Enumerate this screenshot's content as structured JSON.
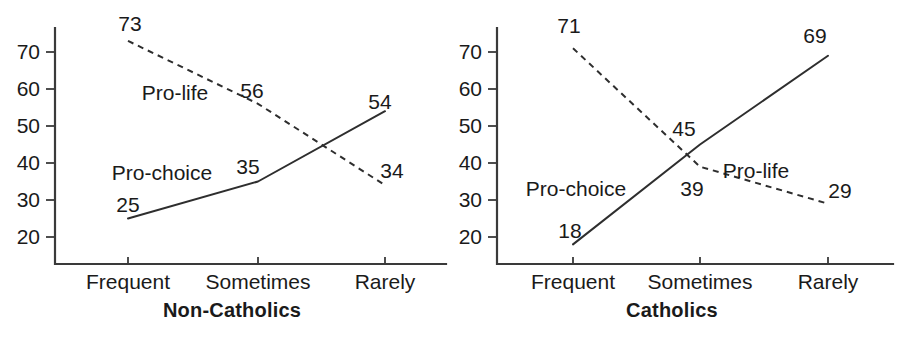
{
  "figure": {
    "background": "#ffffff",
    "ink_color": "#2e2e2e",
    "panel_count": 2
  },
  "chart_data": [
    {
      "type": "line",
      "title": "Non-Catholics",
      "xlabel": "",
      "ylabel": "",
      "categories": [
        "Frequent",
        "Sometimes",
        "Rarely"
      ],
      "yticks": [
        20,
        30,
        40,
        50,
        60,
        70
      ],
      "ylim": [
        15,
        77
      ],
      "grid": false,
      "legend_position": "inline-annotation",
      "series": [
        {
          "name": "Pro-life",
          "style": "dashed",
          "values": [
            73,
            56,
            34
          ],
          "point_labels": [
            "73",
            "56",
            "34"
          ],
          "label_text": "Pro-life"
        },
        {
          "name": "Pro-choice",
          "style": "solid",
          "values": [
            25,
            35,
            54
          ],
          "point_labels": [
            "25",
            "35",
            "54"
          ],
          "label_text": "Pro-choice"
        }
      ]
    },
    {
      "type": "line",
      "title": "Catholics",
      "xlabel": "",
      "ylabel": "",
      "categories": [
        "Frequent",
        "Sometimes",
        "Rarely"
      ],
      "yticks": [
        20,
        30,
        40,
        50,
        60,
        70
      ],
      "ylim": [
        15,
        77
      ],
      "grid": false,
      "legend_position": "inline-annotation",
      "series": [
        {
          "name": "Pro-life",
          "style": "dashed",
          "values": [
            71,
            39,
            29
          ],
          "point_labels": [
            "71",
            "39",
            "29"
          ],
          "label_text": "Pro-life"
        },
        {
          "name": "Pro-choice",
          "style": "solid",
          "values": [
            18,
            45,
            69
          ],
          "point_labels": [
            "18",
            "45",
            "69"
          ],
          "label_text": "Pro-choice"
        }
      ]
    }
  ],
  "annotations": {
    "left": {
      "value_labels": [
        {
          "text": "73",
          "x": 130,
          "y": 25
        },
        {
          "text": "56",
          "x": 252,
          "y": 92
        },
        {
          "text": "34",
          "x": 392,
          "y": 172
        },
        {
          "text": "25",
          "x": 128,
          "y": 206
        },
        {
          "text": "35",
          "x": 248,
          "y": 168
        },
        {
          "text": "54",
          "x": 380,
          "y": 103
        }
      ],
      "series_labels": [
        {
          "text": "Pro-life",
          "x": 175,
          "y": 94
        },
        {
          "text": "Pro-choice",
          "x": 162,
          "y": 174
        }
      ],
      "title_pos": {
        "x": 232,
        "y": 312
      }
    },
    "right": {
      "value_labels": [
        {
          "text": "71",
          "x": 569,
          "y": 27
        },
        {
          "text": "39",
          "x": 692,
          "y": 190
        },
        {
          "text": "29",
          "x": 840,
          "y": 192
        },
        {
          "text": "18",
          "x": 570,
          "y": 232
        },
        {
          "text": "45",
          "x": 684,
          "y": 130
        },
        {
          "text": "69",
          "x": 815,
          "y": 37
        }
      ],
      "series_labels": [
        {
          "text": "Pro-life",
          "x": 756,
          "y": 172
        },
        {
          "text": "Pro-choice",
          "x": 576,
          "y": 190
        }
      ],
      "title_pos": {
        "x": 672,
        "y": 312
      }
    }
  },
  "geometry": {
    "left": {
      "axis_x": 55,
      "axis_top": 28,
      "axis_bottom": 264,
      "axis_right": 446,
      "cat_x": [
        128,
        258,
        385
      ],
      "y_for_70": 52,
      "y_for_20": 237,
      "tick_len": 9,
      "xtick_len": 7
    },
    "right": {
      "axis_x": 497,
      "axis_top": 28,
      "axis_bottom": 264,
      "axis_right": 893,
      "cat_x": [
        573,
        700,
        828
      ],
      "y_for_70": 52,
      "y_for_20": 237,
      "tick_len": 9,
      "xtick_len": 7
    }
  }
}
